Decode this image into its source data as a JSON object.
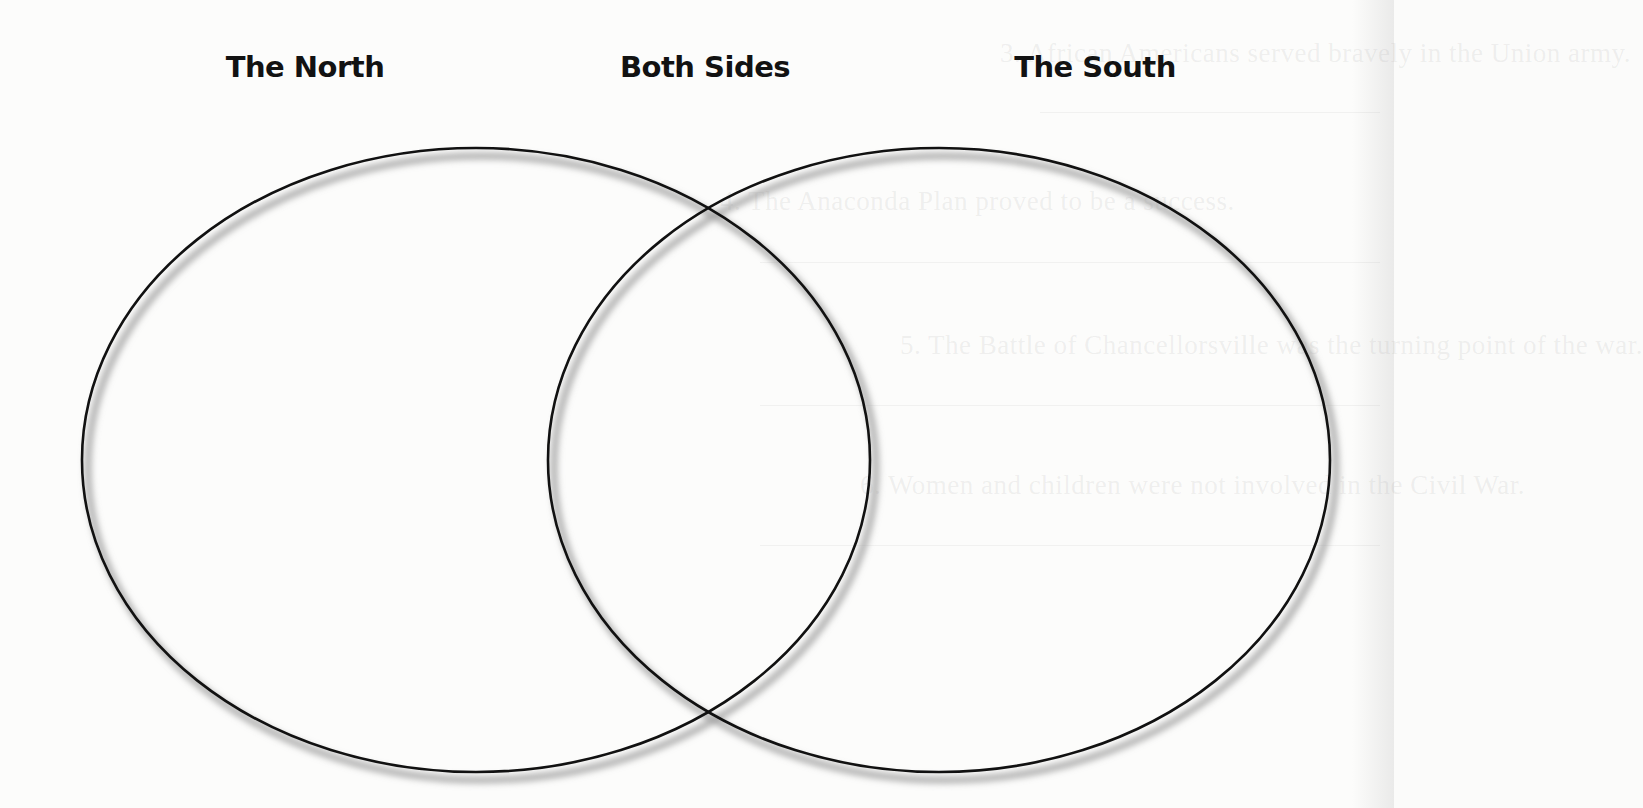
{
  "diagram": {
    "type": "venn",
    "headings": {
      "left": "The North",
      "center": "Both Sides",
      "right": "The South"
    },
    "sets": [
      {
        "id": "north",
        "label": "The North",
        "cx": 476,
        "cy": 460,
        "rx": 394,
        "ry": 312
      },
      {
        "id": "south",
        "label": "The South",
        "cx": 939,
        "cy": 460,
        "rx": 391,
        "ry": 312
      }
    ],
    "stroke_color": "#111111",
    "shadow_color": "#9a9a9a",
    "background_color": "#fcfcfb"
  },
  "bleed_through": {
    "lines": [
      {
        "text": "3.  African Americans served bravely in the Union army.",
        "y": 60
      },
      {
        "text": "4.  The Anaconda Plan proved to be a success.",
        "y": 208
      },
      {
        "text": "5.  The Battle of Chancellorsville was the turning point of the war.",
        "y": 352
      },
      {
        "text": "6.  Women and children were not involved in the Civil War.",
        "y": 492
      }
    ]
  }
}
